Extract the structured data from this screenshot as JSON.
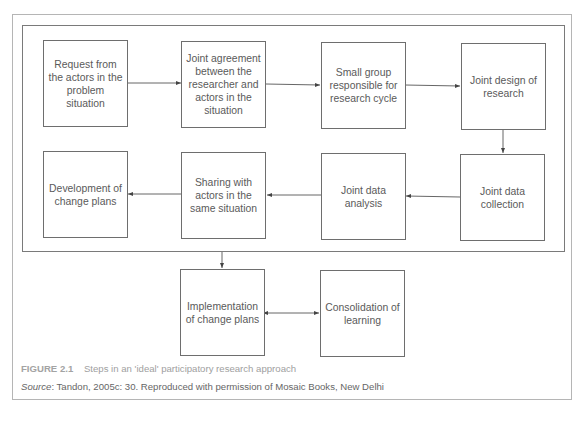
{
  "diagram": {
    "steps": [
      {
        "id": "request",
        "label": "Request from the actors in the problem situation"
      },
      {
        "id": "agreement",
        "label": "Joint agreement between the researcher and actors in the situation"
      },
      {
        "id": "small-group",
        "label": "Small group responsible for research cycle"
      },
      {
        "id": "design",
        "label": "Joint design of research"
      },
      {
        "id": "collection",
        "label": "Joint data collection"
      },
      {
        "id": "analysis",
        "label": "Joint data analysis"
      },
      {
        "id": "sharing",
        "label": "Sharing with actors in the same situation"
      },
      {
        "id": "development",
        "label": "Development of change plans"
      },
      {
        "id": "implementation",
        "label": "Implementation of change plans"
      },
      {
        "id": "consolidation",
        "label": "Consolidation of learning"
      }
    ],
    "edges": [
      {
        "from": "request",
        "to": "agreement"
      },
      {
        "from": "agreement",
        "to": "small-group"
      },
      {
        "from": "small-group",
        "to": "design"
      },
      {
        "from": "design",
        "to": "collection"
      },
      {
        "from": "collection",
        "to": "analysis"
      },
      {
        "from": "analysis",
        "to": "sharing"
      },
      {
        "from": "sharing",
        "to": "development"
      },
      {
        "from": "cycle-frame",
        "to": "implementation"
      },
      {
        "from": "implementation",
        "to": "consolidation",
        "bidirectional": true
      }
    ]
  },
  "caption": {
    "figure_label": "FIGURE 2.1",
    "title": "Steps in an 'ideal' participatory research approach",
    "source_label": "Source",
    "source_text": ": Tandon, 2005c: 30. Reproduced with permission of Mosaic Books, New Delhi"
  },
  "colors": {
    "box_border": "#6e6e6e",
    "frame_border": "#7a7a7a",
    "outer_border": "#b5b5b5",
    "caption_gray": "#a0a0a0"
  }
}
